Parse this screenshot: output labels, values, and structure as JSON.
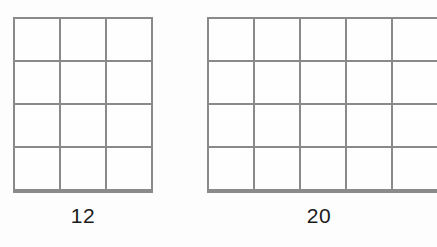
{
  "page": {
    "background_color": "#fdfdfd",
    "line_color": "#8a8a8a",
    "label_color": "#1b1b1b"
  },
  "figures": [
    {
      "id": "left",
      "name": "grid-12",
      "rows": 4,
      "columns": 3,
      "total_cells": 12,
      "label": "12"
    },
    {
      "id": "right",
      "name": "grid-20",
      "rows": 4,
      "columns": 5,
      "total_cells": 20,
      "label": "20"
    }
  ],
  "chart_data": {
    "type": "table",
    "title": "",
    "xlabel": "",
    "ylabel": "",
    "categories": [
      "12",
      "20"
    ],
    "values": [
      12,
      20
    ],
    "series": [
      {
        "name": "rows",
        "values": [
          4,
          4
        ]
      },
      {
        "name": "columns",
        "values": [
          3,
          5
        ]
      },
      {
        "name": "cell count",
        "values": [
          12,
          20
        ]
      }
    ],
    "annotations": [
      "12",
      "20"
    ],
    "grid": true,
    "legend": "none"
  }
}
